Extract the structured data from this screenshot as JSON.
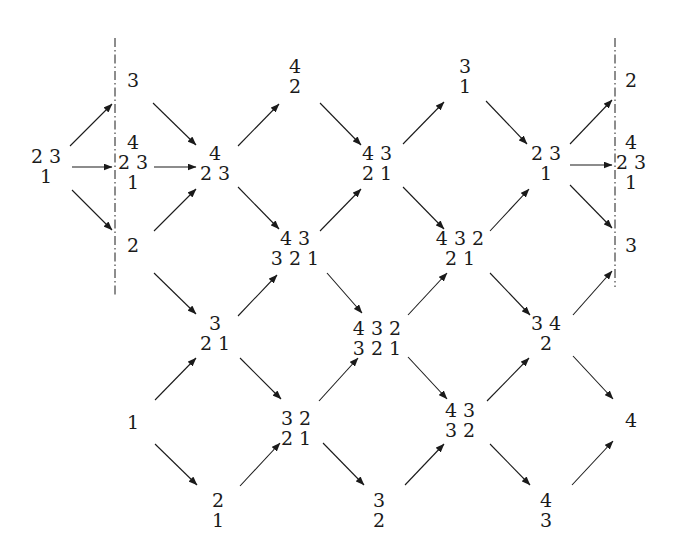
{
  "diagram": {
    "type": "directed lattice of partition-like configurations",
    "nodes": [
      {
        "id": "n0",
        "x": 46,
        "y": 146,
        "rows": [
          "2 3",
          "1"
        ]
      },
      {
        "id": "n1",
        "x": 133,
        "y": 70,
        "rows": [
          "3"
        ]
      },
      {
        "id": "n2",
        "x": 133,
        "y": 132,
        "rows": [
          "4",
          "2 3",
          "1"
        ]
      },
      {
        "id": "n3",
        "x": 133,
        "y": 235,
        "rows": [
          "2"
        ]
      },
      {
        "id": "n4",
        "x": 215,
        "y": 143,
        "rows": [
          "4",
          "2 3"
        ]
      },
      {
        "id": "n5",
        "x": 295,
        "y": 56,
        "rows": [
          "4",
          "2"
        ]
      },
      {
        "id": "n6",
        "x": 295,
        "y": 228,
        "rows": [
          "4 3",
          "3 2 1"
        ]
      },
      {
        "id": "n7",
        "x": 215,
        "y": 313,
        "rows": [
          "3",
          "2 1"
        ]
      },
      {
        "id": "n8",
        "x": 133,
        "y": 412,
        "rows": [
          "1"
        ]
      },
      {
        "id": "n9",
        "x": 218,
        "y": 490,
        "rows": [
          "2",
          "1"
        ]
      },
      {
        "id": "n10",
        "x": 296,
        "y": 408,
        "rows": [
          "3 2",
          "2 1"
        ]
      },
      {
        "id": "n11",
        "x": 377,
        "y": 143,
        "rows": [
          "4 3",
          "2 1"
        ]
      },
      {
        "id": "n12",
        "x": 377,
        "y": 318,
        "rows": [
          "4 3 2",
          "3 2 1"
        ]
      },
      {
        "id": "n13",
        "x": 379,
        "y": 490,
        "rows": [
          "3",
          "2"
        ]
      },
      {
        "id": "n14",
        "x": 465,
        "y": 56,
        "rows": [
          "3",
          "1"
        ]
      },
      {
        "id": "n15",
        "x": 460,
        "y": 228,
        "rows": [
          "4 3 2",
          "2 1"
        ]
      },
      {
        "id": "n16",
        "x": 460,
        "y": 400,
        "rows": [
          "4 3",
          "3 2"
        ]
      },
      {
        "id": "n17",
        "x": 546,
        "y": 143,
        "rows": [
          "2 3",
          "1"
        ]
      },
      {
        "id": "n18",
        "x": 546,
        "y": 313,
        "rows": [
          "3 4",
          "2"
        ]
      },
      {
        "id": "n19",
        "x": 546,
        "y": 490,
        "rows": [
          "4",
          "3"
        ]
      },
      {
        "id": "n20",
        "x": 631,
        "y": 70,
        "rows": [
          "2"
        ]
      },
      {
        "id": "n21",
        "x": 631,
        "y": 132,
        "rows": [
          "4",
          "2 3",
          "1"
        ]
      },
      {
        "id": "n22",
        "x": 631,
        "y": 235,
        "rows": [
          "3"
        ]
      },
      {
        "id": "n23",
        "x": 631,
        "y": 410,
        "rows": [
          "4"
        ]
      }
    ],
    "edges": [
      {
        "from": "n0",
        "to": "n1",
        "x1": 70,
        "y1": 146,
        "x2": 112,
        "y2": 104
      },
      {
        "from": "n0",
        "to": "n2",
        "x1": 72,
        "y1": 167,
        "x2": 112,
        "y2": 167
      },
      {
        "from": "n0",
        "to": "n3",
        "x1": 72,
        "y1": 190,
        "x2": 112,
        "y2": 230
      },
      {
        "from": "n1",
        "to": "n4",
        "x1": 153,
        "y1": 103,
        "x2": 196,
        "y2": 145
      },
      {
        "from": "n2",
        "to": "n4",
        "x1": 154,
        "y1": 167,
        "x2": 196,
        "y2": 167
      },
      {
        "from": "n3",
        "to": "n4",
        "x1": 154,
        "y1": 231,
        "x2": 196,
        "y2": 189
      },
      {
        "from": "n3",
        "to": "n7",
        "x1": 154,
        "y1": 273,
        "x2": 196,
        "y2": 314
      },
      {
        "from": "n4",
        "to": "n5",
        "x1": 238,
        "y1": 146,
        "x2": 279,
        "y2": 104
      },
      {
        "from": "n4",
        "to": "n6",
        "x1": 238,
        "y1": 187,
        "x2": 279,
        "y2": 229
      },
      {
        "from": "n5",
        "to": "n11",
        "x1": 320,
        "y1": 103,
        "x2": 361,
        "y2": 145
      },
      {
        "from": "n6",
        "to": "n11",
        "x1": 320,
        "y1": 231,
        "x2": 361,
        "y2": 189
      },
      {
        "from": "n6",
        "to": "n12",
        "x1": 327,
        "y1": 273,
        "x2": 362,
        "y2": 313
      },
      {
        "from": "n7",
        "to": "n6",
        "x1": 238,
        "y1": 316,
        "x2": 277,
        "y2": 275
      },
      {
        "from": "n7",
        "to": "n10",
        "x1": 240,
        "y1": 358,
        "x2": 281,
        "y2": 399
      },
      {
        "from": "n8",
        "to": "n7",
        "x1": 155,
        "y1": 400,
        "x2": 196,
        "y2": 358
      },
      {
        "from": "n8",
        "to": "n9",
        "x1": 155,
        "y1": 444,
        "x2": 197,
        "y2": 485
      },
      {
        "from": "n9",
        "to": "n10",
        "x1": 240,
        "y1": 486,
        "x2": 280,
        "y2": 443
      },
      {
        "from": "n10",
        "to": "n12",
        "x1": 319,
        "y1": 401,
        "x2": 358,
        "y2": 358
      },
      {
        "from": "n10",
        "to": "n13",
        "x1": 323,
        "y1": 443,
        "x2": 364,
        "y2": 485
      },
      {
        "from": "n11",
        "to": "n14",
        "x1": 403,
        "y1": 144,
        "x2": 444,
        "y2": 102
      },
      {
        "from": "n11",
        "to": "n15",
        "x1": 403,
        "y1": 187,
        "x2": 444,
        "y2": 229
      },
      {
        "from": "n12",
        "to": "n15",
        "x1": 408,
        "y1": 315,
        "x2": 447,
        "y2": 273
      },
      {
        "from": "n12",
        "to": "n16",
        "x1": 408,
        "y1": 357,
        "x2": 447,
        "y2": 399
      },
      {
        "from": "n13",
        "to": "n16",
        "x1": 405,
        "y1": 485,
        "x2": 444,
        "y2": 444
      },
      {
        "from": "n14",
        "to": "n17",
        "x1": 486,
        "y1": 101,
        "x2": 527,
        "y2": 144
      },
      {
        "from": "n15",
        "to": "n17",
        "x1": 490,
        "y1": 231,
        "x2": 529,
        "y2": 189
      },
      {
        "from": "n15",
        "to": "n18",
        "x1": 490,
        "y1": 273,
        "x2": 530,
        "y2": 315
      },
      {
        "from": "n16",
        "to": "n18",
        "x1": 487,
        "y1": 401,
        "x2": 529,
        "y2": 358
      },
      {
        "from": "n16",
        "to": "n19",
        "x1": 490,
        "y1": 444,
        "x2": 530,
        "y2": 485
      },
      {
        "from": "n17",
        "to": "n20",
        "x1": 570,
        "y1": 144,
        "x2": 612,
        "y2": 100
      },
      {
        "from": "n17",
        "to": "n21",
        "x1": 570,
        "y1": 165,
        "x2": 612,
        "y2": 165
      },
      {
        "from": "n17",
        "to": "n22",
        "x1": 570,
        "y1": 185,
        "x2": 612,
        "y2": 228
      },
      {
        "from": "n18",
        "to": "n22",
        "x1": 573,
        "y1": 315,
        "x2": 612,
        "y2": 271
      },
      {
        "from": "n18",
        "to": "n23",
        "x1": 573,
        "y1": 356,
        "x2": 613,
        "y2": 399
      },
      {
        "from": "n19",
        "to": "n23",
        "x1": 572,
        "y1": 485,
        "x2": 613,
        "y2": 441
      }
    ],
    "dashdot_lines": [
      {
        "name": "left-boundary",
        "x": 115,
        "y1": 38,
        "y2": 296
      },
      {
        "name": "right-boundary",
        "x": 615,
        "y1": 38,
        "y2": 287
      }
    ],
    "colors": {
      "ink": "#1a1a1a",
      "background": "#ffffff"
    }
  }
}
